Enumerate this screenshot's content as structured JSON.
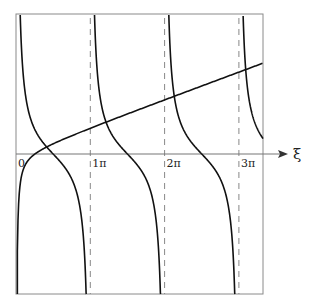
{
  "chart_data": {
    "type": "line",
    "title": "",
    "xlabel": "ξ",
    "ylabel": "",
    "x_ticks": [
      {
        "value": 0,
        "label": "0"
      },
      {
        "value": 3.14159,
        "label": "1π"
      },
      {
        "value": 6.28319,
        "label": "2π"
      },
      {
        "value": 9.42478,
        "label": "3π"
      }
    ],
    "xlim": [
      0,
      10.5
    ],
    "ylim": [
      -5.6,
      5.6
    ],
    "grid": false,
    "asymptotes": {
      "style": "dashed",
      "x": [
        3.14159,
        6.28319,
        9.42478
      ]
    },
    "series": [
      {
        "name": "cot ξ",
        "kind": "cot",
        "scale": 1.0,
        "color": "#111111",
        "branches": [
          [
            0,
            3.14159
          ],
          [
            3.14159,
            6.28319
          ],
          [
            6.28319,
            9.42478
          ],
          [
            9.42478,
            10.5
          ]
        ]
      },
      {
        "name": "rising curve",
        "kind": "a*ξ - b/ξ",
        "a": 0.35,
        "b": 0.224,
        "color": "#111111"
      }
    ],
    "intersections_approx_x": [
      0.82,
      3.58,
      6.6,
      9.6
    ],
    "legend": null
  },
  "axis": {
    "x_label": "ξ",
    "origin_label": "0"
  }
}
